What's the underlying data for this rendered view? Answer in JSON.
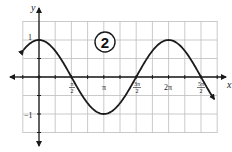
{
  "chart_data": {
    "type": "line",
    "function": "y = cos(x)",
    "title": "",
    "badge": "2",
    "xlabel": "x",
    "ylabel": "y",
    "x_ticks": [
      {
        "value": 1.5708,
        "label": "π/2",
        "num": "π",
        "den": "2"
      },
      {
        "value": 3.1416,
        "label": "π"
      },
      {
        "value": 4.7124,
        "label": "3π/2",
        "num": "3π",
        "den": "2"
      },
      {
        "value": 6.2832,
        "label": "2π"
      },
      {
        "value": 7.854,
        "label": "5π/2",
        "num": "5π",
        "den": "2"
      }
    ],
    "y_ticks": [
      {
        "value": 1,
        "label": "1"
      },
      {
        "value": -1,
        "label": "-1"
      }
    ],
    "xlim": [
      -0.75,
      8.5
    ],
    "ylim": [
      -1.5,
      1.5
    ],
    "grid": true,
    "x_grid_step": "π/4",
    "y_grid_step": 0.5,
    "series": [
      {
        "name": "cos(x)",
        "x": [
          -0.75,
          0,
          1.5708,
          3.1416,
          4.7124,
          6.2832,
          7.854,
          8.5
        ],
        "y": [
          0.73,
          1,
          0,
          -1,
          0,
          1,
          0,
          -0.6
        ]
      }
    ],
    "arrows_on_curve_ends": true
  },
  "labels": {
    "y_axis": "y",
    "x_axis": "x",
    "one": "1",
    "neg_one": "−1",
    "pi_over_2_num": "π",
    "pi_over_2_den": "2",
    "pi": "π",
    "three_pi_over_2_num": "3π",
    "three_pi_over_2_den": "2",
    "two_pi": "2π",
    "five_pi_over_2_num": "5π",
    "five_pi_over_2_den": "2",
    "badge": "2"
  }
}
